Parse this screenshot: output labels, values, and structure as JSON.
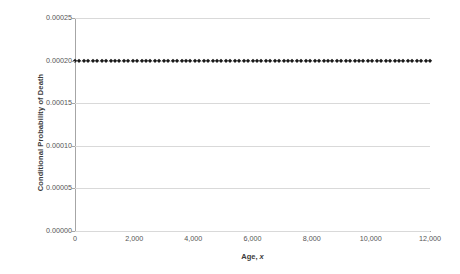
{
  "chart_data": {
    "type": "scatter",
    "title": "",
    "xlabel": "Age, x",
    "xlabel_plain": "Age, ",
    "xlabel_italic": "x",
    "ylabel": "Conditional Probability of Death",
    "xlim": [
      0,
      12000
    ],
    "ylim": [
      0,
      0.00025
    ],
    "grid": true,
    "legend": false,
    "marker": "filled-diamond",
    "marker_color": "#1a1a1a",
    "gridline_color": "#d9d9d9",
    "axis_color": "#a6a6a6",
    "x_tick_labels": [
      "0",
      "2,000",
      "4,000",
      "6,000",
      "8,000",
      "10,000",
      "12,000"
    ],
    "x_tick_values": [
      0,
      2000,
      4000,
      6000,
      8000,
      10000,
      12000
    ],
    "y_tick_labels": [
      "0.00000",
      "0.00005",
      "0.00010",
      "0.00015",
      "0.00020",
      "0.00025"
    ],
    "y_tick_values": [
      0.0,
      5e-05,
      0.0001,
      0.00015,
      0.0002,
      0.00025
    ],
    "series": [
      {
        "name": "Conditional Probability of Death",
        "constant_value": 0.0002,
        "x_start": 0,
        "x_end": 12000,
        "x_step": 150,
        "n_points": 81,
        "description": "Constant conditional probability of death of 0.00020 across all ages from 0 to 12,000"
      }
    ]
  }
}
